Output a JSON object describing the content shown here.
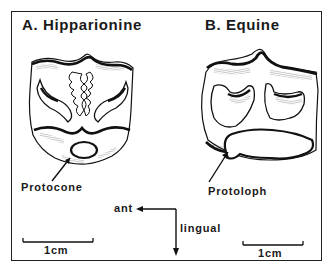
{
  "figure": {
    "panel_a": {
      "title": "A. Hipparionine",
      "callout": "Protocone",
      "scale_bar": "1cm"
    },
    "panel_b": {
      "title": "B. Equine",
      "callout": "Protoloph",
      "scale_bar": "1cm"
    },
    "orientation": {
      "horizontal_label": "ant",
      "vertical_label": "lingual"
    }
  }
}
